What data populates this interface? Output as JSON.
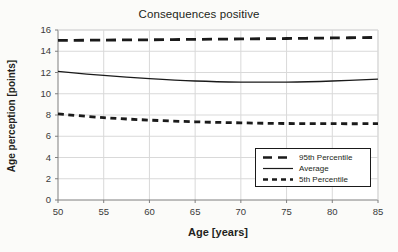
{
  "chart_data": {
    "type": "line",
    "title": "Consequences positive",
    "xlabel": "Age [years]",
    "ylabel": "Age perception [points]",
    "xlim": [
      50,
      85
    ],
    "ylim": [
      0,
      16
    ],
    "xticks": [
      50,
      55,
      60,
      65,
      70,
      75,
      80,
      85
    ],
    "yticks": [
      0,
      2,
      4,
      6,
      8,
      10,
      12,
      14,
      16
    ],
    "grid": true,
    "legend_position": "lower right",
    "x": [
      50,
      55,
      60,
      65,
      70,
      75,
      80,
      85
    ],
    "series": [
      {
        "name": "95th Percentile",
        "style": "long-dash",
        "color": "#1a1a1a",
        "values": [
          15.02,
          15.05,
          15.08,
          15.12,
          15.16,
          15.2,
          15.25,
          15.3
        ]
      },
      {
        "name": "Average",
        "style": "solid",
        "color": "#1a1a1a",
        "values": [
          12.1,
          11.72,
          11.42,
          11.2,
          11.1,
          11.1,
          11.2,
          11.38
        ]
      },
      {
        "name": "5th Percentile",
        "style": "short-dash",
        "color": "#1a1a1a",
        "values": [
          8.1,
          7.75,
          7.52,
          7.36,
          7.26,
          7.2,
          7.18,
          7.18
        ]
      }
    ]
  },
  "axes": {
    "y_tick_labels": [
      "16",
      "14",
      "12",
      "10",
      "8",
      "6",
      "4",
      "2",
      "0"
    ],
    "x_tick_labels": [
      "50",
      "55",
      "60",
      "65",
      "70",
      "75",
      "80",
      "85"
    ]
  },
  "legend": {
    "entries": [
      {
        "label": "95th Percentile",
        "style": "long-dash"
      },
      {
        "label": "Average",
        "style": "solid"
      },
      {
        "label": "5th Percentile",
        "style": "short-dash"
      }
    ]
  },
  "colors": {
    "line": "#1a1a1a",
    "grid": "#d9d9d9",
    "axis": "#7f7f7f",
    "plot_background": "#ffffff",
    "page_background": "#fbfbf9",
    "text": "#231f20"
  }
}
